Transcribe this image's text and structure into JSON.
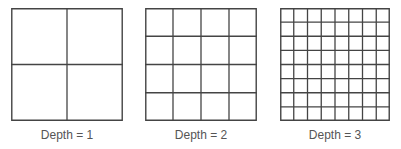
{
  "figure": {
    "line_color": "#444444",
    "caption_color": "#555555",
    "panels": [
      {
        "caption": "Depth = 1",
        "depth": 1,
        "divisions": 2
      },
      {
        "caption": "Depth = 2",
        "depth": 2,
        "divisions": 4
      },
      {
        "caption": "Depth = 3",
        "depth": 3,
        "divisions": 8
      }
    ]
  }
}
